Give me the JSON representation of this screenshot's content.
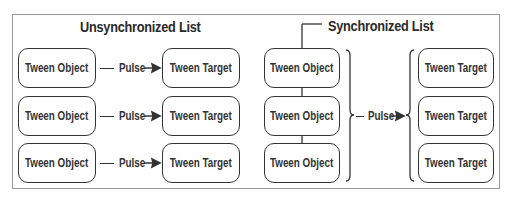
{
  "unsynchronized": {
    "title": "Unsynchronized List",
    "rows": [
      {
        "object": "Tween Object",
        "pulse": "Pulse",
        "target": "Tween Target"
      },
      {
        "object": "Tween Object",
        "pulse": "Pulse",
        "target": "Tween Target"
      },
      {
        "object": "Tween Object",
        "pulse": "Pulse",
        "target": "Tween Target"
      }
    ]
  },
  "synchronized": {
    "title": "Synchronized List",
    "objects": [
      "Tween Object",
      "Tween Object",
      "Tween Object"
    ],
    "pulse": "Pulse",
    "targets": [
      "Tween Target",
      "Tween Target",
      "Tween Target"
    ]
  }
}
